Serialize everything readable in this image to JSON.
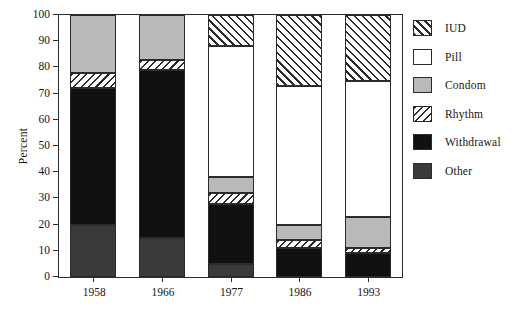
{
  "chart_data": {
    "type": "bar",
    "subtype": "stacked-bar",
    "title": "",
    "xlabel": "",
    "ylabel": "Percent",
    "ylim": [
      0,
      100
    ],
    "yticks": [
      0,
      10,
      20,
      30,
      40,
      50,
      60,
      70,
      80,
      90,
      100
    ],
    "ytick_labels": [
      "0",
      "10",
      "20",
      "30",
      "40",
      "50",
      "60",
      "70",
      "80",
      "90",
      "100"
    ],
    "categories": [
      "1958",
      "1966",
      "1977",
      "1986",
      "1993"
    ],
    "grid": false,
    "legend_position": "right",
    "stack_order_bottom_to_top": [
      "Other",
      "Withdrawal",
      "Rhythm",
      "Condom",
      "Pill",
      "IUD"
    ],
    "series": [
      {
        "name": "Other",
        "values": [
          20,
          15,
          5,
          0,
          0
        ]
      },
      {
        "name": "Withdrawal",
        "values": [
          52,
          64,
          23,
          11,
          9
        ]
      },
      {
        "name": "Rhythm",
        "values": [
          6,
          4,
          4,
          3,
          2
        ]
      },
      {
        "name": "Condom",
        "values": [
          22,
          17,
          6,
          6,
          12
        ]
      },
      {
        "name": "Pill",
        "values": [
          0,
          0,
          50,
          53,
          52
        ]
      },
      {
        "name": "IUD",
        "values": [
          0,
          0,
          12,
          27,
          25
        ]
      }
    ],
    "cumulative_tops": {
      "1958": {
        "Other": 20,
        "Withdrawal": 72,
        "Rhythm": 78,
        "Condom": 100
      },
      "1966": {
        "Other": 15,
        "Withdrawal": 79,
        "Rhythm": 83,
        "Condom": 100
      },
      "1977": {
        "Other": 5,
        "Withdrawal": 28,
        "Rhythm": 32,
        "Condom": 38,
        "Pill": 88,
        "IUD": 100
      },
      "1986": {
        "Withdrawal": 11,
        "Rhythm": 14,
        "Condom": 20,
        "Pill": 73,
        "IUD": 100
      },
      "1993": {
        "Withdrawal": 9,
        "Rhythm": 11,
        "Condom": 23,
        "Pill": 75,
        "IUD": 100
      }
    }
  },
  "legend": {
    "items": [
      {
        "label": "IUD",
        "pattern": "diagonal-hatch-up",
        "color": "#ffffff"
      },
      {
        "label": "Pill",
        "pattern": "solid",
        "color": "#ffffff"
      },
      {
        "label": "Condom",
        "pattern": "solid",
        "color": "#b9b9b9"
      },
      {
        "label": "Rhythm",
        "pattern": "diagonal-hatch-down",
        "color": "#ffffff"
      },
      {
        "label": "Withdrawal",
        "pattern": "solid",
        "color": "#101010"
      },
      {
        "label": "Other",
        "pattern": "solid",
        "color": "#3a3a3a"
      }
    ]
  },
  "axes": {
    "y_label": "Percent"
  },
  "title_strip": ""
}
